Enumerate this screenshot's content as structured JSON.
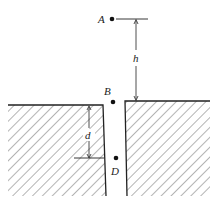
{
  "diagram": {
    "labels": {
      "A": "A",
      "B": "B",
      "D": "D",
      "h": "h",
      "d": "d"
    },
    "caption": "",
    "colors": {
      "line": "#222222",
      "hatch": "#444444",
      "background": "#ffffff"
    }
  }
}
